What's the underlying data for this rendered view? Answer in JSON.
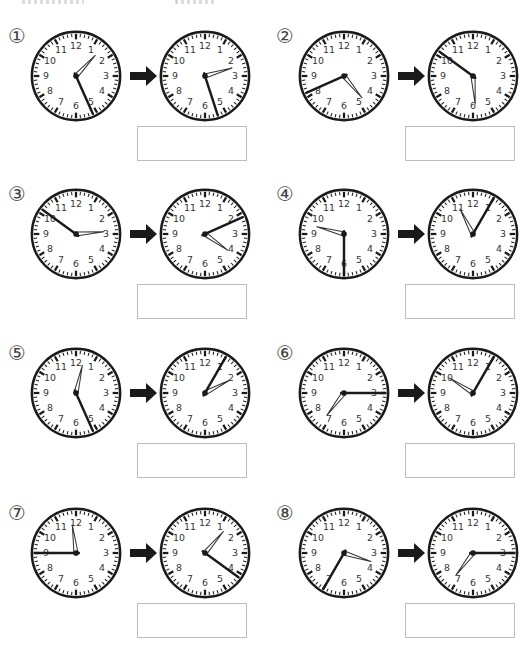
{
  "worksheet": {
    "header_fragments": [
      "",
      ""
    ],
    "problems": [
      {
        "number": "①",
        "from": {
          "hour": 1,
          "minute": 26
        },
        "to": {
          "hour": 2,
          "minute": 27
        },
        "answer": ""
      },
      {
        "number": "②",
        "from": {
          "hour": 4,
          "minute": 41
        },
        "to": {
          "hour": 5,
          "minute": 51
        },
        "answer": ""
      },
      {
        "number": "③",
        "from": {
          "hour": 2,
          "minute": 51
        },
        "to": {
          "hour": 4,
          "minute": 11
        },
        "answer": ""
      },
      {
        "number": "④",
        "from": {
          "hour": 9,
          "minute": 30
        },
        "to": {
          "hour": 11,
          "minute": 5
        },
        "answer": ""
      },
      {
        "number": "⑤",
        "from": {
          "hour": 12,
          "minute": 26
        },
        "to": {
          "hour": 2,
          "minute": 5
        },
        "answer": ""
      },
      {
        "number": "⑥",
        "from": {
          "hour": 7,
          "minute": 15
        },
        "to": {
          "hour": 10,
          "minute": 5
        },
        "answer": ""
      },
      {
        "number": "⑦",
        "from": {
          "hour": 11,
          "minute": 45
        },
        "to": {
          "hour": 1,
          "minute": 21
        },
        "answer": ""
      },
      {
        "number": "⑧",
        "from": {
          "hour": 3,
          "minute": 35
        },
        "to": {
          "hour": 7,
          "minute": 15
        },
        "answer": ""
      }
    ],
    "clock_face": {
      "numerals": [
        "12",
        "1",
        "2",
        "3",
        "4",
        "5",
        "6",
        "7",
        "8",
        "9",
        "10",
        "11"
      ],
      "rim_color": "#1a1a1a",
      "minute_hand_color": "#1a1a1a",
      "hour_hand_fill": "#ffffff",
      "hour_hand_stroke": "#333333"
    },
    "arrow_icon": "right-arrow"
  }
}
